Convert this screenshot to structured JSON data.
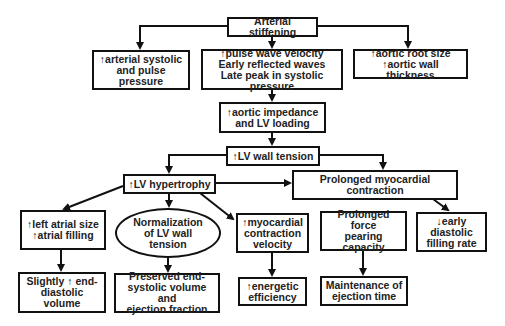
{
  "diagram": {
    "nodes": {
      "arterial_stiffening": "Arterial stiffening",
      "arterial_pressure": "↑arterial systolic\nand pulse pressure",
      "pulse_wave": "↑pulse wave velocity\nEarly reflected waves\nLate peak in systolic pressure",
      "aortic_root": "↑aortic root size\n↑aortic wall thickness",
      "aortic_impedance": "↑aortic impedance\nand LV loading",
      "lv_wall_tension": "↑LV wall tension",
      "lv_hypertrophy": "↑LV hypertrophy",
      "prolonged_contraction": "Prolonged myocardial contraction",
      "left_atrial": "↑left atrial size\n↑atrial filling",
      "normalization": "Normalization\nof LV wall\ntension",
      "myocardial_velocity": "↑myocardial\ncontraction\nvelocity",
      "force_bearing": "Prolonged force\npearing capacity",
      "early_filling": "↓early\ndiastolic\nfilling rate",
      "end_diastolic": "Slightly ↑ end-\ndiastolic volume",
      "preserved": "Preserved end-\nsystolic volume and\nejection fraction",
      "energetic": "↑energetic\nefficiency",
      "ejection_time": "Maintenance of\nejection time"
    }
  }
}
